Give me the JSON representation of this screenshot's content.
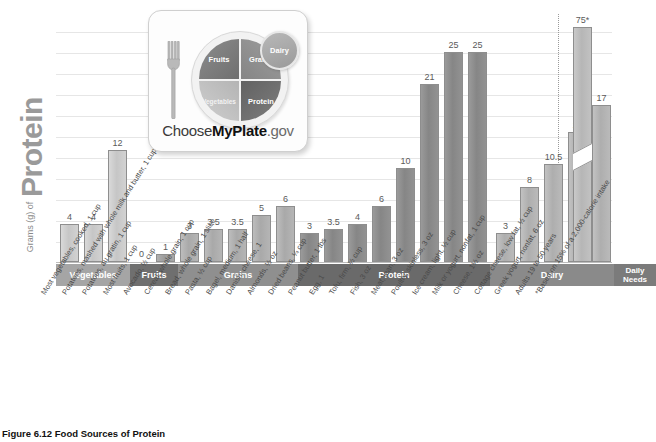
{
  "caption": "Figure 6.12  Food Sources of Protein",
  "axis": {
    "y_title_small": "Grams (g) of",
    "y_title_large": "Protein"
  },
  "logo": {
    "brand_choose": "Choose",
    "brand_myplate": "MyPlate",
    "brand_gov": ".gov",
    "fruits": "Fruits",
    "grains": "Grains",
    "vegetables": "Vegetables",
    "protein": "Protein",
    "dairy": "Dairy"
  },
  "categories": [
    {
      "name": "Vegetables",
      "color": "#a5a5a5",
      "count": 3
    },
    {
      "name": "Fruits",
      "color": "#6f6f6f",
      "count": 2
    },
    {
      "name": "Grains",
      "color": "#8f8f8f",
      "count": 6
    },
    {
      "name": "Protein",
      "color": "#6a6a6a",
      "count": 8
    },
    {
      "name": "Dairy",
      "color": "#8a8a8a",
      "count": 5
    },
    {
      "name": "Daily Needs",
      "color": "#7b7b7b",
      "count": 1
    }
  ],
  "chart_data": {
    "type": "bar",
    "title": "Figure 6.12  Food Sources of Protein",
    "xlabel": "",
    "ylabel": "Grams (g) of Protein",
    "ylim": [
      0,
      28
    ],
    "grid": true,
    "legend": "none",
    "note": "Daily Needs bar value 75 g is drawn with a broken axis",
    "categories": [
      "Most vegetables, cooked, 1 cup",
      "Potatoes, mashed with whole milk and butter, 1 cup",
      "Potatoes, au gratin, 1 cup",
      "Most fruits, 1 cup",
      "Avocado, ½ cup",
      "Cereal, whole grain, 1 cup",
      "Bread, whole grain, 1 slice",
      "Pasta, ½ cup",
      "Bagel, medium, 1 half",
      "Danish, cheese, 1",
      "Almonds, ½ oz",
      "Dried beans, ¼ cup",
      "Peanut butter, 1 tbs",
      "Egg, 1",
      "Tofu, firm, ½ cup",
      "Fish, 3 oz",
      "Meat, lean, 3 oz",
      "Poultry, skinless, 3 oz",
      "Ice cream, light, ½ cup",
      "Milk or yogurt, nonfat, 1 cup",
      "Cheese, 1½ oz",
      "Cottage cheese, low fat, ½ cup",
      "Greek yogurt, nonfat, 6 oz",
      "Adults 19 to 50 years *Based on 15% of a 2,000-calorie intake"
    ],
    "values": [
      4,
      4,
      12,
      0,
      1,
      3,
      3.5,
      3.5,
      5,
      6,
      3,
      3.5,
      4,
      6,
      10,
      21,
      25,
      25,
      3,
      8,
      10.5,
      14,
      17,
      75
    ],
    "value_labels": [
      "4",
      "4",
      "12",
      "0",
      "1",
      "3",
      "3.5",
      "3.5",
      "5",
      "6",
      "3",
      "3.5",
      "4",
      "6",
      "10",
      "21",
      "25",
      "25",
      "3",
      "8",
      "10.5",
      "14",
      "17",
      "75*"
    ],
    "groups": [
      "Vegetables",
      "Vegetables",
      "Vegetables",
      "Fruits",
      "Fruits",
      "Grains",
      "Grains",
      "Grains",
      "Grains",
      "Grains",
      "Grains",
      "Protein",
      "Protein",
      "Protein",
      "Protein",
      "Protein",
      "Protein",
      "Protein",
      "Dairy",
      "Dairy",
      "Dairy",
      "Dairy",
      "Dairy",
      "Daily Needs"
    ]
  },
  "bars": [
    {
      "label": "4",
      "cls": "veg",
      "left": 4,
      "w": 19,
      "h": 38,
      "group": "Vegetables"
    },
    {
      "label": "4",
      "cls": "veg",
      "left": 28,
      "w": 19,
      "h": 38,
      "group": "Vegetables"
    },
    {
      "label": "12",
      "cls": "veg",
      "left": 52,
      "w": 19,
      "h": 112,
      "group": "Vegetables"
    },
    {
      "label": "0",
      "cls": "fruit",
      "left": 76,
      "w": 19,
      "h": 0,
      "group": "Fruits",
      "zero": true
    },
    {
      "label": "1",
      "cls": "fruit",
      "left": 100,
      "w": 19,
      "h": 8,
      "group": "Fruits"
    },
    {
      "label": "3",
      "cls": "grain",
      "left": 124,
      "w": 19,
      "h": 29,
      "group": "Grains"
    },
    {
      "label": "3.5",
      "cls": "grain",
      "left": 148,
      "w": 19,
      "h": 33,
      "group": "Grains"
    },
    {
      "label": "3.5",
      "cls": "grain",
      "left": 172,
      "w": 19,
      "h": 33,
      "group": "Grains"
    },
    {
      "label": "5",
      "cls": "grain",
      "left": 196,
      "w": 19,
      "h": 47,
      "group": "Grains"
    },
    {
      "label": "6",
      "cls": "grain",
      "left": 220,
      "w": 19,
      "h": 56,
      "group": "Grains"
    },
    {
      "label": "3",
      "cls": "prot",
      "left": 244,
      "w": 19,
      "h": 29,
      "group": "Protein"
    },
    {
      "label": "3.5",
      "cls": "prot",
      "left": 268,
      "w": 19,
      "h": 33,
      "group": "Protein"
    },
    {
      "label": "4",
      "cls": "prot",
      "left": 292,
      "w": 19,
      "h": 38,
      "group": "Protein"
    },
    {
      "label": "6",
      "cls": "prot",
      "left": 316,
      "w": 19,
      "h": 56,
      "group": "Protein"
    },
    {
      "label": "10",
      "cls": "prot",
      "left": 340,
      "w": 19,
      "h": 94,
      "group": "Protein"
    },
    {
      "label": "21",
      "cls": "prot",
      "left": 364,
      "w": 19,
      "h": 178,
      "group": "Protein"
    },
    {
      "label": "25",
      "cls": "prot",
      "left": 388,
      "w": 19,
      "h": 210,
      "group": "Protein"
    },
    {
      "label": "25",
      "cls": "prot",
      "left": 412,
      "w": 19,
      "h": 210,
      "group": "Protein"
    },
    {
      "label": "3",
      "cls": "dairy",
      "left": 440,
      "w": 19,
      "h": 29,
      "group": "Dairy"
    },
    {
      "label": "8",
      "cls": "dairy",
      "left": 464,
      "w": 19,
      "h": 75,
      "group": "Dairy"
    },
    {
      "label": "10.5",
      "cls": "dairy",
      "left": 488,
      "w": 19,
      "h": 98,
      "group": "Dairy"
    },
    {
      "label": "14",
      "cls": "dairy",
      "left": 512,
      "w": 19,
      "h": 130,
      "group": "Dairy"
    },
    {
      "label": "17",
      "cls": "dairy",
      "left": 536,
      "w": 19,
      "h": 157,
      "group": "Dairy"
    },
    {
      "label": "75*",
      "cls": "needs",
      "left": 517,
      "w": 19,
      "h": 235,
      "group": "Daily Needs",
      "broken": true
    }
  ],
  "xlabels": [
    "Most vegetables, cooked, 1 cup",
    "Potatoes, mashed with whole milk and butter, 1 cup",
    "Potatoes, au gratin, 1 cup",
    "Most fruits, 1 cup",
    "Avocado, ½ cup",
    "Cereal, whole grain, 1 cup",
    "Bread, whole grain, 1 slice",
    "Pasta, ½ cup",
    "Bagel, medium, 1 half",
    "Danish, cheese, 1",
    "Almonds, ½ oz",
    "Dried beans, ¼ cup",
    "Peanut butter, 1 tbs",
    "Egg, 1",
    "Tofu, firm, ½ cup",
    "Fish, 3 oz",
    "Meat, lean, 3 oz",
    "Poultry, skinless, 3 oz",
    "Ice cream, light, ½ cup",
    "Milk or yogurt, nonfat, 1 cup",
    "Cheese, 1½ oz",
    "Cottage cheese, low fat, ½ cup",
    "Greek yogurt, nonfat, 6 oz",
    "Adults 19 to 50 years",
    "*Based on 15% of a 2,000-calorie intake"
  ],
  "bands": [
    {
      "label": "Vegetables",
      "left": 0,
      "w": 74,
      "color": "#a5a5a5",
      "two": false
    },
    {
      "label": "Fruits",
      "left": 74,
      "w": 48,
      "color": "#6f6f6f",
      "two": false
    },
    {
      "label": "Grains",
      "left": 122,
      "w": 120,
      "color": "#8f8f8f",
      "two": false
    },
    {
      "label": "Protein",
      "left": 242,
      "w": 192,
      "color": "#6a6a6a",
      "two": false
    },
    {
      "label": "Dairy",
      "left": 434,
      "w": 124,
      "color": "#8a8a8a",
      "two": false
    },
    {
      "label": "Daily\nNeeds",
      "left": 558,
      "w": 42,
      "color": "#7b7b7b",
      "two": true
    }
  ]
}
